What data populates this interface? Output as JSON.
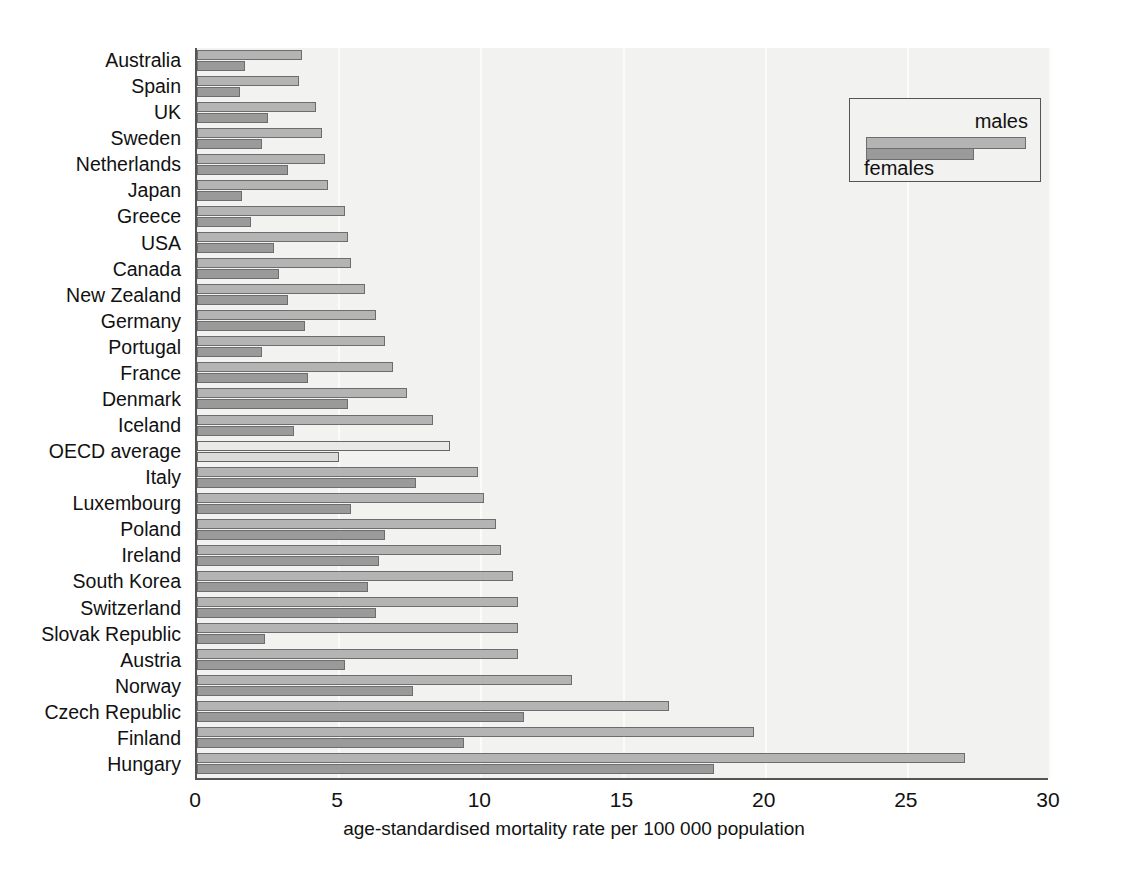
{
  "chart_data": {
    "type": "bar",
    "orientation": "horizontal",
    "title": "",
    "xlabel": "age-standardised mortality rate per 100 000 population",
    "ylabel": "",
    "xlim": [
      0,
      30
    ],
    "xticks": [
      0,
      5,
      10,
      15,
      20,
      25,
      30
    ],
    "grid": true,
    "grid_axis": "x",
    "legend": {
      "position": "top-right",
      "entries": [
        "males",
        "females"
      ]
    },
    "categories": [
      "Australia",
      "Spain",
      "UK",
      "Sweden",
      "Netherlands",
      "Japan",
      "Greece",
      "USA",
      "Canada",
      "New Zealand",
      "Germany",
      "Portugal",
      "France",
      "Denmark",
      "Iceland",
      "OECD average",
      "Italy",
      "Luxembourg",
      "Poland",
      "Ireland",
      "South Korea",
      "Switzerland",
      "Slovak Republic",
      "Austria",
      "Norway",
      "Czech Republic",
      "Finland",
      "Hungary"
    ],
    "series": [
      {
        "name": "males",
        "color": "#b4b4b4",
        "values": [
          3.7,
          3.6,
          4.2,
          4.4,
          4.5,
          4.6,
          5.2,
          5.3,
          5.4,
          5.9,
          6.3,
          6.6,
          6.9,
          7.4,
          8.3,
          8.9,
          9.9,
          10.1,
          10.5,
          10.7,
          11.1,
          11.3,
          11.3,
          11.3,
          13.2,
          16.6,
          19.6,
          27.0
        ]
      },
      {
        "name": "females",
        "color": "#9a9a9a",
        "values": [
          1.7,
          1.5,
          2.5,
          2.3,
          3.2,
          1.6,
          1.9,
          2.7,
          2.9,
          3.2,
          3.8,
          2.3,
          3.9,
          5.3,
          3.4,
          5.0,
          7.7,
          5.4,
          6.6,
          6.4,
          6.0,
          6.3,
          2.4,
          5.2,
          7.6,
          11.5,
          9.4,
          18.2
        ]
      }
    ],
    "highlight_category": "OECD average",
    "highlight_colors": {
      "males": "#e9e9e7",
      "females": "#dcdcda"
    }
  },
  "axis": {
    "tick_labels": [
      "0",
      "5",
      "10",
      "15",
      "20",
      "25",
      "30"
    ],
    "x_axis_title": "age-standardised mortality rate per 100 000 population"
  },
  "legend": {
    "males_label": "males",
    "females_label": "females"
  },
  "colors": {
    "plot_background": "#f2f2f0",
    "axis": "#555555",
    "males_bar": "#b4b4b4",
    "females_bar": "#9a9a9a",
    "bar_border": "#6d6d6d",
    "gridline": "#fbfbfa"
  }
}
